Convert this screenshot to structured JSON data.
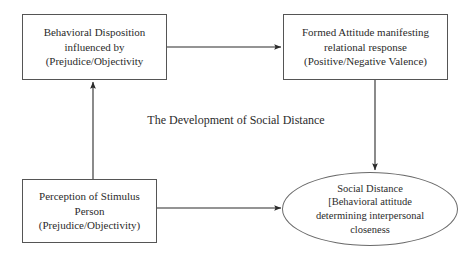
{
  "diagram": {
    "title": "The Development of Social Distance",
    "caption": "The Development of Social Distance",
    "background_color": "#ffffff",
    "ink_color": "#2b2b2b",
    "stroke_color": "#555555",
    "nodes": [
      {
        "id": "behavioral-disposition",
        "shape": "rectangle",
        "lines": [
          "Behavioral Disposition",
          "influenced by",
          "(Prejudice/Objectivity"
        ]
      },
      {
        "id": "formed-attitude",
        "shape": "rectangle",
        "lines": [
          "Formed Attitude manifesting",
          "relational response",
          "(Positive/Negative Valence)"
        ]
      },
      {
        "id": "perception-stimulus",
        "shape": "rectangle",
        "lines": [
          "Perception of Stimulus",
          "Person",
          "(Prejudice/Objectivity)"
        ]
      },
      {
        "id": "social-distance",
        "shape": "ellipse",
        "lines": [
          "Social Distance",
          "[Behavioral attitude",
          "determining interpersonal",
          "closeness"
        ]
      }
    ],
    "connectors": [
      {
        "id": "disposition-to-attitude",
        "from": "behavioral-disposition",
        "to": "formed-attitude",
        "direction": "right"
      },
      {
        "id": "attitude-to-social-distance",
        "from": "formed-attitude",
        "to": "social-distance",
        "direction": "down"
      },
      {
        "id": "perception-to-disposition",
        "from": "perception-stimulus",
        "to": "behavioral-disposition",
        "direction": "up"
      },
      {
        "id": "perception-to-social-distance",
        "from": "perception-stimulus",
        "to": "social-distance",
        "direction": "right"
      }
    ]
  }
}
